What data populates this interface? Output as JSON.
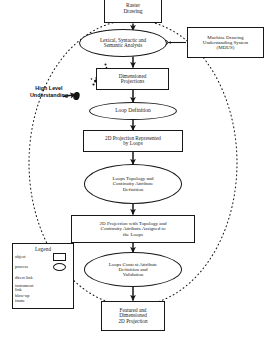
{
  "diagram": {
    "nodes": {
      "raster_drawing": "Raster\nDrawing",
      "lexical_analysis": "Lexical, Syntactic and\nSemantic Analysis",
      "mdus": "Machine Drawing\nUnderstanding System\n(MDUS)",
      "dimensioned_projections": "Dimensioned\nProjections",
      "loop_definition": "Loop Definition",
      "projection_by_loops": "2D Projection Represented\nby Loops",
      "loops_topology": "Loops Topology and\nContinuity Attribute\nDefinition",
      "projection_with_topology": "2D Projection with Topology and\nContinuity Attributs Assigned to\nthe Loops",
      "loops_context": "Loops Context Attribute\nDefinition and\nValidation",
      "featured_projection": "Featured and\nDimensioned\n2D Projection"
    },
    "annotations": {
      "high_level_understanding": "High Level\nUnderstanding"
    },
    "legend": {
      "title": "Legend",
      "items": [
        {
          "label": "object",
          "symbol": "rectangle-shape"
        },
        {
          "label": "process",
          "symbol": "ellipse-shape"
        },
        {
          "label": "direct link",
          "symbol": "solid-arrow-icon"
        },
        {
          "label": "instrument\nlink",
          "symbol": "thin-arrow-icon"
        },
        {
          "label": "blow-up\nframe",
          "symbol": "dotted-frame-icon"
        }
      ]
    },
    "colors": {
      "stroke": "#171717",
      "background": "#ffffff",
      "text": "#1a1a1a"
    }
  }
}
